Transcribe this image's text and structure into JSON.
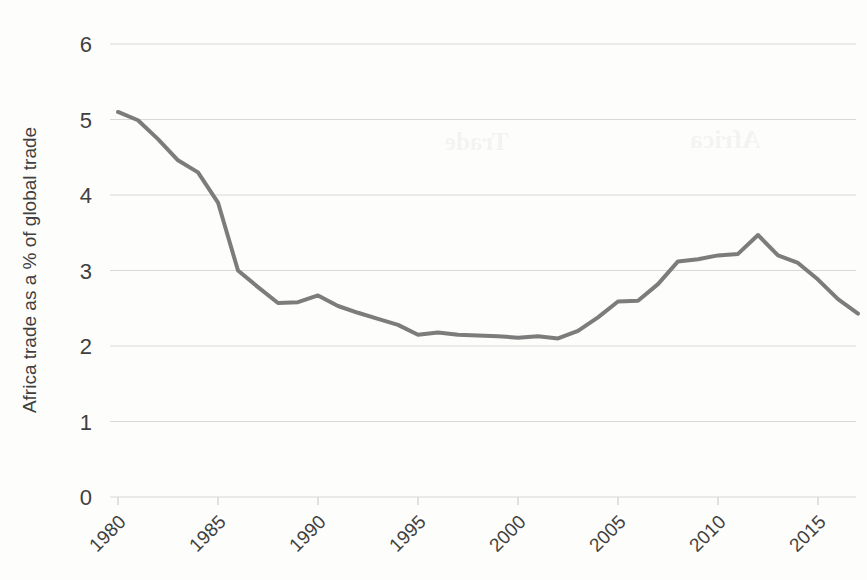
{
  "chart_data": {
    "type": "line",
    "title": "",
    "subtitle": "",
    "xlabel": "",
    "ylabel": "Africa trade as a % of global trade",
    "xlim": [
      1980,
      2017
    ],
    "ylim": [
      0,
      6
    ],
    "grid": "horizontal",
    "legend": "none",
    "line_color": "#7c7c7c",
    "line_width": 4,
    "x_tick_labels": [
      "1980",
      "1985",
      "1990",
      "1995",
      "2000",
      "2005",
      "2010",
      "2015"
    ],
    "x_tick_values": [
      1980,
      1985,
      1990,
      1995,
      2000,
      2005,
      2010,
      2015
    ],
    "x_tick_rotation": 45,
    "y_tick_labels": [
      "0",
      "1",
      "2",
      "3",
      "4",
      "5",
      "6"
    ],
    "y_tick_values": [
      0,
      1,
      2,
      3,
      4,
      5,
      6
    ],
    "series": [
      {
        "name": "Africa trade as a % of global trade",
        "color": "#7c7c7c",
        "x": [
          1980,
          1981,
          1982,
          1983,
          1984,
          1985,
          1986,
          1987,
          1988,
          1989,
          1990,
          1991,
          1992,
          1993,
          1994,
          1995,
          1996,
          1997,
          1998,
          1999,
          2000,
          2001,
          2002,
          2003,
          2004,
          2005,
          2006,
          2007,
          2008,
          2009,
          2010,
          2011,
          2012,
          2013,
          2014,
          2015,
          2016,
          2017
        ],
        "values": [
          5.1,
          4.99,
          4.74,
          4.46,
          4.3,
          3.9,
          3.0,
          2.78,
          2.57,
          2.58,
          2.67,
          2.53,
          2.44,
          2.36,
          2.28,
          2.15,
          2.18,
          2.15,
          2.14,
          2.13,
          2.11,
          2.13,
          2.1,
          2.2,
          2.38,
          2.59,
          2.6,
          2.82,
          3.12,
          3.15,
          3.2,
          3.22,
          3.47,
          3.2,
          3.1,
          2.88,
          2.62,
          2.43
        ]
      }
    ],
    "annotations": []
  },
  "artifacts": {
    "bleed_1": "Trade",
    "bleed_2": "Africa"
  }
}
